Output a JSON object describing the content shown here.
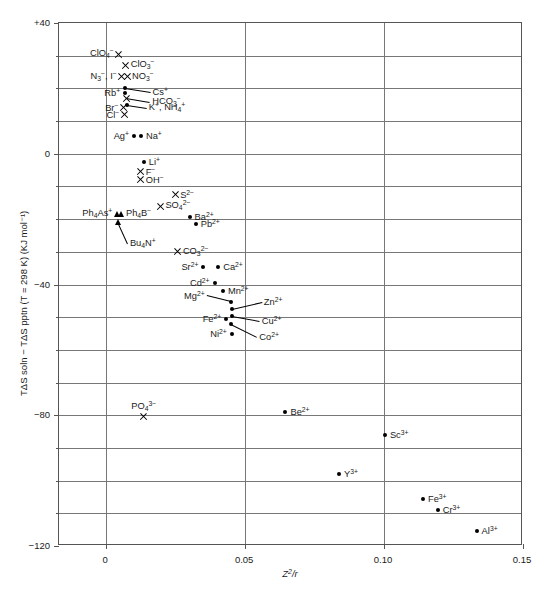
{
  "figure": {
    "axis_titles": {
      "x": "Z²/r",
      "y": "TΔS soln − TΔS pptn (T = 298 K) (KJ mol⁻¹)"
    }
  },
  "chart_data": {
    "type": "scatter",
    "title": "",
    "xlabel": "Z²/r",
    "ylabel": "TΔS soln − TΔS pptn (T = 298 K) (KJ mol⁻¹)",
    "xlim": [
      -0.017,
      0.15
    ],
    "ylim": [
      -120,
      40
    ],
    "xticks": [
      0,
      0.05,
      0.1,
      0.15
    ],
    "xtick_labels": [
      "0",
      "0.05",
      "0.10",
      "0.15"
    ],
    "yticks": [
      40,
      0,
      -40,
      -80,
      -120
    ],
    "ytick_labels": [
      "+40",
      "0",
      "−40",
      "−80",
      "−120"
    ],
    "y_minor_gridlines": [
      30,
      20,
      10,
      -10,
      -20,
      -30,
      -50,
      -60,
      -70,
      -90,
      -100,
      -110
    ],
    "grid": "horizontal-major-and-minor + vertical at x ticks",
    "legend": "none (points labelled directly)",
    "marker_shapes": {
      "circle": "filled circle",
      "cross": "x-cross",
      "triangle": "filled triangle"
    },
    "points": [
      {
        "id": "ClO4-",
        "label": "ClO<sub>4</sub><sup>−</sup>",
        "x": 0.0045,
        "y": 30.5,
        "marker": "cross",
        "label_side": "left"
      },
      {
        "id": "ClO3-",
        "label": "ClO<sub>3</sub><sup>−</sup>",
        "x": 0.007,
        "y": 27.0,
        "marker": "cross",
        "label_side": "right"
      },
      {
        "id": "NO3-",
        "label": "NO<sub>3</sub><sup>−</sup>",
        "x": 0.0075,
        "y": 23.5,
        "marker": "cross",
        "label_side": "right"
      },
      {
        "id": "N3-",
        "label": "N<sub>3</sub><sup>−</sup>, I<sup>−</sup>",
        "x": 0.0056,
        "y": 23.5,
        "marker": "cross",
        "label_side": "left"
      },
      {
        "id": "Cs+",
        "label": "Cs<sup>+</sup>",
        "x": 0.0066,
        "y": 20.0,
        "marker": "circle",
        "label_side": "leader-right"
      },
      {
        "id": "Rb+",
        "label": "Rb<sup>+</sup>",
        "x": 0.0068,
        "y": 18.6,
        "marker": "circle",
        "label_side": "left"
      },
      {
        "id": "HCO3-",
        "label": "HCO<sub>3</sub><sup>−</sup>",
        "x": 0.0072,
        "y": 17.0,
        "marker": "cross",
        "label_side": "leader-right"
      },
      {
        "id": "Br-",
        "label": "Br<sup>−</sup>",
        "x": 0.0062,
        "y": 14.0,
        "marker": "cross",
        "label_side": "left"
      },
      {
        "id": "K+NH4+",
        "label": "K<sup>+</sup>, NH<sub>4</sub><sup>+</sup>",
        "x": 0.0074,
        "y": 15.0,
        "marker": "circle",
        "label_side": "leader-right"
      },
      {
        "id": "Cl-",
        "label": "Cl<sup>−</sup>",
        "x": 0.0065,
        "y": 12.0,
        "marker": "cross",
        "label_side": "left"
      },
      {
        "id": "Ag+",
        "label": "Ag<sup>+</sup>",
        "x": 0.01,
        "y": 5.5,
        "marker": "circle",
        "label_side": "left"
      },
      {
        "id": "Na+",
        "label": "Na<sup>+</sup>",
        "x": 0.0125,
        "y": 5.5,
        "marker": "circle",
        "label_side": "right"
      },
      {
        "id": "Li+",
        "label": "Li<sup>+</sup>",
        "x": 0.0135,
        "y": -2.5,
        "marker": "circle",
        "label_side": "right"
      },
      {
        "id": "F-",
        "label": "F<sup>−</sup>",
        "x": 0.0124,
        "y": -5.5,
        "marker": "cross",
        "label_side": "right"
      },
      {
        "id": "OH-",
        "label": "OH<sup>−</sup>",
        "x": 0.0124,
        "y": -8.0,
        "marker": "cross",
        "label_side": "right"
      },
      {
        "id": "S2-",
        "label": "S<sup>2−</sup>",
        "x": 0.0248,
        "y": -12.5,
        "marker": "cross",
        "label_side": "right"
      },
      {
        "id": "SO42-",
        "label": "SO<sub>4</sub><sup>2−</sup>",
        "x": 0.0195,
        "y": -16.0,
        "marker": "cross",
        "label_side": "right"
      },
      {
        "id": "Ph4As+",
        "label": "Ph<sub>4</sub>As<sup>+</sup>",
        "x": 0.004,
        "y": -18.5,
        "marker": "triangle",
        "label_side": "left"
      },
      {
        "id": "Ph4B-",
        "label": "Ph<sub>4</sub>B<sup>−</sup>",
        "x": 0.0053,
        "y": -18.5,
        "marker": "triangle",
        "label_side": "right"
      },
      {
        "id": "Ba2+",
        "label": "Ba<sup>2+</sup>",
        "x": 0.03,
        "y": -19.5,
        "marker": "circle",
        "label_side": "leader-right"
      },
      {
        "id": "Pb2+",
        "label": "Pb<sup>2+</sup>",
        "x": 0.0322,
        "y": -21.5,
        "marker": "circle",
        "label_side": "right"
      },
      {
        "id": "Bu4N+",
        "label": "Bu<sub>4</sub>N<sup>+</sup>",
        "x": 0.0042,
        "y": -21.0,
        "marker": "triangle",
        "label_side": "leader-below"
      },
      {
        "id": "CO32-",
        "label": "CO<sub>3</sub><sup>2−</sup>",
        "x": 0.0258,
        "y": -30.0,
        "marker": "cross",
        "label_side": "right"
      },
      {
        "id": "Sr2+",
        "label": "Sr<sup>2+</sup>",
        "x": 0.035,
        "y": -34.5,
        "marker": "circle",
        "label_side": "left"
      },
      {
        "id": "Ca2+",
        "label": "Ca<sup>2+</sup>",
        "x": 0.0403,
        "y": -34.5,
        "marker": "circle",
        "label_side": "right"
      },
      {
        "id": "Cd2+",
        "label": "Cd<sup>2+</sup>",
        "x": 0.039,
        "y": -39.5,
        "marker": "circle",
        "label_side": "left"
      },
      {
        "id": "Mn2+",
        "label": "Mn<sup>2+</sup>",
        "x": 0.042,
        "y": -42.0,
        "marker": "circle",
        "label_side": "right"
      },
      {
        "id": "Mg2+",
        "label": "Mg<sup>2+</sup>",
        "x": 0.0448,
        "y": -45.5,
        "marker": "circle",
        "label_side": "leader-left"
      },
      {
        "id": "Zn2+",
        "label": "Zn<sup>2+</sup>",
        "x": 0.0452,
        "y": -47.5,
        "marker": "circle",
        "label_side": "leader-right"
      },
      {
        "id": "Cu2+",
        "label": "Cu<sup>2+</sup>",
        "x": 0.0452,
        "y": -49.5,
        "marker": "circle",
        "label_side": "leader-right"
      },
      {
        "id": "Fe2+",
        "label": "Fe<sup>2+</sup>",
        "x": 0.0432,
        "y": -50.5,
        "marker": "circle",
        "label_side": "left"
      },
      {
        "id": "Co2+",
        "label": "Co<sup>2+</sup>",
        "x": 0.045,
        "y": -52.0,
        "marker": "circle",
        "label_side": "leader-right"
      },
      {
        "id": "Ni2+",
        "label": "Ni<sup>2+</sup>",
        "x": 0.0452,
        "y": -55.0,
        "marker": "circle",
        "label_side": "left"
      },
      {
        "id": "PO43-",
        "label": "PO<sub>4</sub><sup>3−</sup>",
        "x": 0.0135,
        "y": -80.5,
        "marker": "cross",
        "label_side": "above"
      },
      {
        "id": "Be2+",
        "label": "Be<sup>2+</sup>",
        "x": 0.0645,
        "y": -79.0,
        "marker": "circle",
        "label_side": "right"
      },
      {
        "id": "Sc3+",
        "label": "Sc<sup>3+</sup>",
        "x": 0.1003,
        "y": -86.0,
        "marker": "circle",
        "label_side": "right"
      },
      {
        "id": "Y3+",
        "label": "Y<sup>3+</sup>",
        "x": 0.0838,
        "y": -98.0,
        "marker": "circle",
        "label_side": "right"
      },
      {
        "id": "Fe3+",
        "label": "Fe<sup>3+</sup>",
        "x": 0.114,
        "y": -105.5,
        "marker": "circle",
        "label_side": "right"
      },
      {
        "id": "Cr3+",
        "label": "Cr<sup>3+</sup>",
        "x": 0.1193,
        "y": -109.0,
        "marker": "circle",
        "label_side": "right"
      },
      {
        "id": "Al3+",
        "label": "Al<sup>3+</sup>",
        "x": 0.1333,
        "y": -115.5,
        "marker": "circle",
        "label_side": "right"
      }
    ],
    "leaders": [
      {
        "from": "Cs+",
        "dx": 26,
        "dy": 4
      },
      {
        "from": "HCO3-",
        "dx": 24,
        "dy": 4
      },
      {
        "from": "K+NH4+",
        "dx": 20,
        "dy": 3
      },
      {
        "from": "Bu4N+",
        "dx": 10,
        "dy": 22
      },
      {
        "from": "Mg2+",
        "dx": -24,
        "dy": -6
      },
      {
        "from": "Zn2+",
        "dx": 30,
        "dy": -7
      },
      {
        "from": "Cu2+",
        "dx": 28,
        "dy": 5
      },
      {
        "from": "Co2+",
        "dx": 26,
        "dy": 13
      }
    ]
  }
}
